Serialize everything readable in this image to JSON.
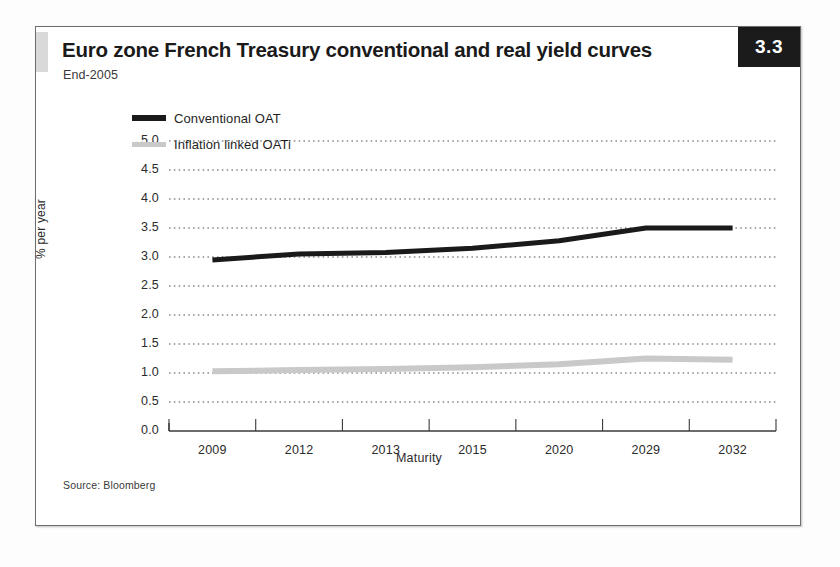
{
  "figure": {
    "title": "Euro zone French Treasury conventional and real yield curves",
    "subtitle": "End-2005",
    "number_badge": "3.3",
    "source": "Source: Bloomberg"
  },
  "colors": {
    "conventional_line": "#1a1a1a",
    "inflation_line": "#c9c9c9",
    "gridline": "#555555",
    "axis": "#3a3a3a",
    "badge_background": "#1b1b1b",
    "accent_bar": "#d9d9d9"
  },
  "legend": {
    "position": "top-left-inside",
    "entries": [
      {
        "label": "Conventional OAT",
        "color": "#1a1a1a",
        "style": "thick"
      },
      {
        "label": "Inflation linked OATi",
        "color": "#c9c9c9",
        "style": "thin"
      }
    ]
  },
  "chart_data": {
    "type": "line",
    "title": "Euro zone French Treasury conventional and real yield curves",
    "subtitle": "End-2005",
    "xlabel": "Maturity",
    "ylabel": "% per year",
    "categories": [
      "2009",
      "2012",
      "2013",
      "2015",
      "2020",
      "2029",
      "2032"
    ],
    "ylim": [
      0.0,
      5.0
    ],
    "yticks": [
      "0.0",
      "0.5",
      "1.0",
      "1.5",
      "2.0",
      "2.5",
      "3.0",
      "3.5",
      "4.0",
      "4.5",
      "5.0"
    ],
    "ytick_values": [
      0.0,
      0.5,
      1.0,
      1.5,
      2.0,
      2.5,
      3.0,
      3.5,
      4.0,
      4.5,
      5.0
    ],
    "grid": "horizontal-dotted",
    "legend_position": "upper left",
    "series": [
      {
        "name": "Conventional OAT",
        "color": "#1a1a1a",
        "values": [
          2.95,
          3.05,
          3.08,
          3.15,
          3.28,
          3.5,
          3.5
        ]
      },
      {
        "name": "Inflation linked OATi",
        "color": "#c9c9c9",
        "values": [
          1.03,
          1.05,
          1.07,
          1.1,
          1.15,
          1.25,
          1.23
        ]
      }
    ],
    "source": "Source: Bloomberg"
  }
}
